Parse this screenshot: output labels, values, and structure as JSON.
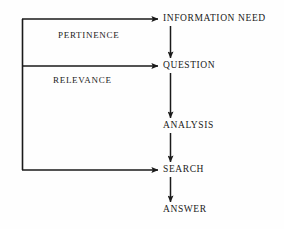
{
  "diagram": {
    "background_color": "#fefefe",
    "line_color": "#1a1a1a",
    "text_color": "#1a1a1a",
    "nodes": [
      {
        "id": "information_need",
        "label": "INFORMATION NEED"
      },
      {
        "id": "question",
        "label": "QUESTION"
      },
      {
        "id": "analysis",
        "label": "ANALYSIS"
      },
      {
        "id": "search",
        "label": "SEARCH"
      },
      {
        "id": "answer",
        "label": "ANSWER"
      }
    ],
    "edge_labels": [
      {
        "id": "pertinence",
        "label": "PERTINENCE"
      },
      {
        "id": "relevance",
        "label": "RELEVANCE"
      }
    ],
    "flow_edges": [
      {
        "from": "information_need",
        "to": "question",
        "direction": "down"
      },
      {
        "from": "question",
        "to": "analysis",
        "direction": "down"
      },
      {
        "from": "analysis",
        "to": "search",
        "direction": "down"
      },
      {
        "from": "search",
        "to": "answer",
        "direction": "down"
      }
    ],
    "feedback_edges": [
      {
        "from": "search",
        "to": "information_need",
        "label": "PERTINENCE",
        "direction": "left-up-right"
      },
      {
        "from": "search",
        "to": "question",
        "label": "RELEVANCE",
        "direction": "left-up-right"
      }
    ]
  }
}
